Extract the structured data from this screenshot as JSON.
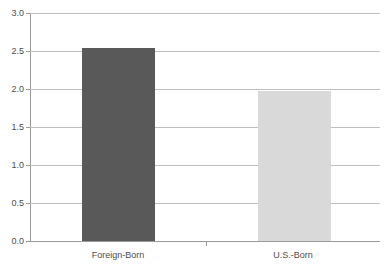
{
  "chart_data": {
    "type": "bar",
    "title": "",
    "subtitle": "",
    "xlabel": "",
    "ylabel": "",
    "categories": [
      "Foreign-Born",
      "U.S.-Born"
    ],
    "values": [
      2.54,
      1.97
    ],
    "series": [
      {
        "name": "",
        "values": [
          2.54,
          1.97
        ]
      }
    ],
    "ylim": [
      0.0,
      3.0
    ],
    "y_ticks": [
      "0.0",
      "0.5",
      "1.0",
      "1.5",
      "2.0",
      "2.5",
      "3.0"
    ],
    "y_tick_values": [
      0.0,
      0.5,
      1.0,
      1.5,
      2.0,
      2.5,
      3.0
    ],
    "grid": "horizontal",
    "legend": "none",
    "bar_colors": [
      "#595959",
      "#d9d9d9"
    ],
    "gridline_color": "#bfbfbf",
    "axis_color": "#9a9a9a",
    "background_color": "#ffffff",
    "annotations": []
  }
}
